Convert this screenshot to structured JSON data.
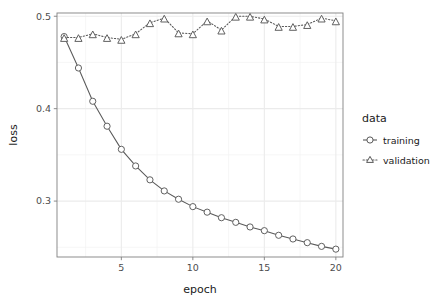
{
  "chart_data": {
    "type": "line",
    "title": "",
    "subtitle": "",
    "xlabel": "epoch",
    "ylabel": "loss",
    "x": [
      1,
      2,
      3,
      4,
      5,
      6,
      7,
      8,
      9,
      10,
      11,
      12,
      13,
      14,
      15,
      16,
      17,
      18,
      19,
      20
    ],
    "xlim": [
      0.5,
      20.5
    ],
    "ylim": [
      0.2395,
      0.5035
    ],
    "xticks": [
      5,
      10,
      15,
      20
    ],
    "xtick_labels": [
      "5",
      "10",
      "15",
      "20"
    ],
    "yticks": [
      0.3,
      0.4,
      0.5
    ],
    "ytick_labels": [
      "0.3",
      "0.4",
      "0.5"
    ],
    "grid": true,
    "grid_color": "#f2f2f2",
    "panel_background": "#ffffff",
    "panel_border_color": "#7f7f7f",
    "legend_position": "right",
    "series": [
      {
        "name": "training",
        "marker": "circle",
        "linestyle": "solid",
        "color": "#595959",
        "values": [
          0.478,
          0.444,
          0.408,
          0.381,
          0.356,
          0.338,
          0.323,
          0.311,
          0.302,
          0.294,
          0.288,
          0.282,
          0.277,
          0.272,
          0.268,
          0.263,
          0.259,
          0.255,
          0.251,
          0.248
        ]
      },
      {
        "name": "validation",
        "marker": "triangle",
        "linestyle": "dotted",
        "color": "#595959",
        "values": [
          0.477,
          0.477,
          0.481,
          0.477,
          0.475,
          0.481,
          0.493,
          0.498,
          0.482,
          0.481,
          0.495,
          0.485,
          0.5,
          0.5,
          0.497,
          0.489,
          0.489,
          0.491,
          0.498,
          0.495
        ]
      }
    ]
  },
  "legend": {
    "title": "data",
    "items": [
      {
        "label": "training",
        "marker": "circle-icon",
        "linestyle": "solid"
      },
      {
        "label": "validation",
        "marker": "triangle-icon",
        "linestyle": "dotted"
      }
    ]
  },
  "axes": {
    "x_title": "epoch",
    "y_title": "loss",
    "x_tick_labels": [
      "5",
      "10",
      "15",
      "20"
    ],
    "y_tick_labels": [
      "0.3",
      "0.4",
      "0.5"
    ]
  }
}
